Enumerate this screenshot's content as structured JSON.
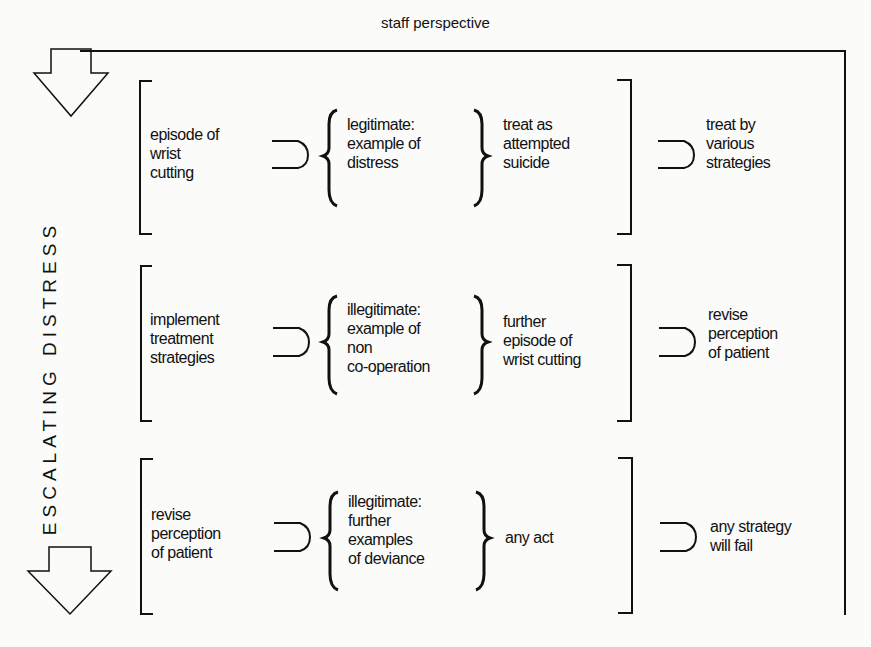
{
  "title": "staff perspective",
  "side_label": "ESCALATING DISTRESS",
  "rows": [
    {
      "behaviour": "episode of\nwrist\ncutting",
      "interpretation": "legitimate:\nexample of\ndistress",
      "response": "treat as\nattempted\nsuicide",
      "outcome": "treat by\nvarious\nstrategies"
    },
    {
      "behaviour": "implement\ntreatment\nstrategies",
      "interpretation": "illegitimate:\nexample of\nnon\nco-operation",
      "response": "further\nepisode of\nwrist cutting",
      "outcome": "revise\nperception\nof patient"
    },
    {
      "behaviour": "revise\nperception\nof patient",
      "interpretation": "illegitimate:\nfurther\nexamples\nof deviance",
      "response": "any act",
      "outcome": "any strategy\nwill fail"
    }
  ],
  "icons": [
    "down-arrow-icon",
    "down-arrow-icon",
    "implies-symbol",
    "curly-brace",
    "square-bracket"
  ]
}
